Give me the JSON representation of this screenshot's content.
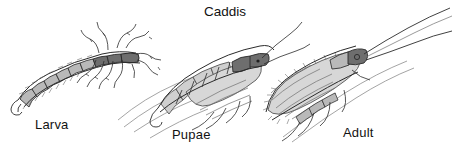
{
  "figure": {
    "title": "Caddis",
    "background_color": "#ffffff",
    "ink_color": "#2b2b2b",
    "text_color": "#121212",
    "medium": "pencil line drawing",
    "stages": [
      {
        "id": "larva",
        "label": "Larva",
        "description": "segmented grub-like larva with thin legs, shown at left"
      },
      {
        "id": "pupae",
        "label": "Pupae",
        "description": "pupa with wing cases, segmented abdomen and long antennae, shown at center"
      },
      {
        "id": "adult",
        "label": "Adult",
        "description": "winged adult caddisfly with tent-shaped wing and long antennae, shown at right"
      }
    ]
  }
}
